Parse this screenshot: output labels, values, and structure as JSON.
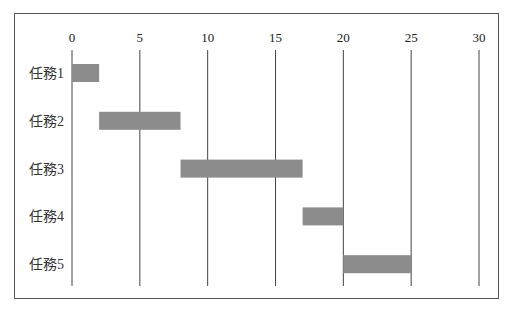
{
  "chart_data": {
    "type": "bar",
    "subtype": "gantt",
    "title": "",
    "xlabel": "",
    "ylabel": "",
    "xlim": [
      0,
      30
    ],
    "x_ticks": [
      0,
      5,
      10,
      15,
      20,
      25,
      30
    ],
    "x_tick_labels": [
      "0",
      "5",
      "10",
      "15",
      "20",
      "25",
      "30"
    ],
    "grid": "vertical",
    "legend": "none",
    "categories": [
      "任務1",
      "任務2",
      "任務3",
      "任務4",
      "任務5"
    ],
    "series": [
      {
        "name": "tasks",
        "color": "#8c8c8c",
        "start": [
          0,
          2,
          8,
          17,
          20
        ],
        "end": [
          2,
          8,
          17,
          20,
          25
        ]
      }
    ]
  }
}
